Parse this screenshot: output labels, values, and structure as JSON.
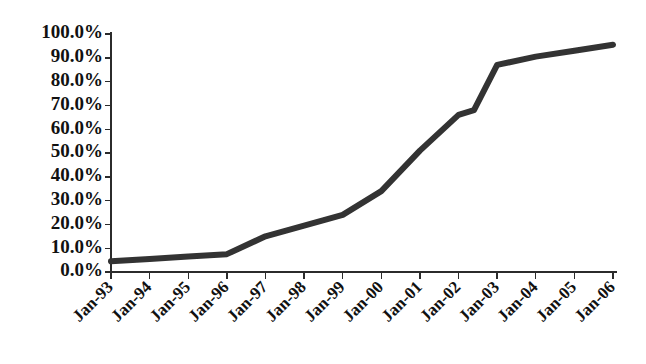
{
  "chart_data": {
    "type": "line",
    "title": "",
    "subtitle": "",
    "xlabel": "",
    "ylabel": "",
    "legend": [],
    "legend_position": "none",
    "grid": false,
    "line_color": "#333333",
    "line_width_px": 6,
    "marker": "none",
    "ylim": [
      0,
      1.0
    ],
    "ytick_labels": [
      "0.0%",
      "10.0%",
      "20.0%",
      "30.0%",
      "40.0%",
      "50.0%",
      "60.0%",
      "70.0%",
      "80.0%",
      "90.0%",
      "100.0%"
    ],
    "ytick_values": [
      0,
      10,
      20,
      30,
      40,
      50,
      60,
      70,
      80,
      90,
      100
    ],
    "categories": [
      "Jan-93",
      "Jan-94",
      "Jan-95",
      "Jan-96",
      "Jan-97",
      "Jan-98",
      "Jan-99",
      "Jan-00",
      "Jan-01",
      "Jan-02",
      "Jan-03",
      "Jan-04",
      "Jan-05",
      "Jan-06"
    ],
    "values": [
      4.5,
      5.5,
      6.5,
      7.5,
      15.0,
      19.5,
      24.0,
      34.0,
      51.0,
      66.0,
      87.0,
      90.5,
      93.0,
      95.5
    ],
    "x_tick_label_rotation_deg": 45,
    "points": [
      {
        "x": "Jan-93",
        "y": 4.5
      },
      {
        "x": "Jan-94",
        "y": 5.5
      },
      {
        "x": "Jan-95",
        "y": 6.5
      },
      {
        "x": "Jan-96",
        "y": 7.5
      },
      {
        "x": "Jan-97",
        "y": 15.0
      },
      {
        "x": "Jan-98",
        "y": 19.5
      },
      {
        "x": "Jan-99",
        "y": 24.0
      },
      {
        "x": "Jan-00",
        "y": 34.0
      },
      {
        "x": "Jan-01",
        "y": 51.0
      },
      {
        "x": "Jan-02",
        "y": 66.0
      },
      {
        "x": "Jan-03",
        "y": 87.0
      },
      {
        "x": "Jan-04",
        "y": 90.5
      },
      {
        "x": "Jan-05",
        "y": 93.0
      },
      {
        "x": "Jan-06",
        "y": 95.5
      }
    ],
    "intermediate_points": [
      {
        "x_fraction": 9.4,
        "y": 68.0
      }
    ],
    "axes": {
      "y_axis_color": "#2b2b2b",
      "x_axis_color": "#2b2b2b",
      "y_axis_ticks_direction": "outward",
      "x_axis_ticks_direction": "outward"
    }
  }
}
